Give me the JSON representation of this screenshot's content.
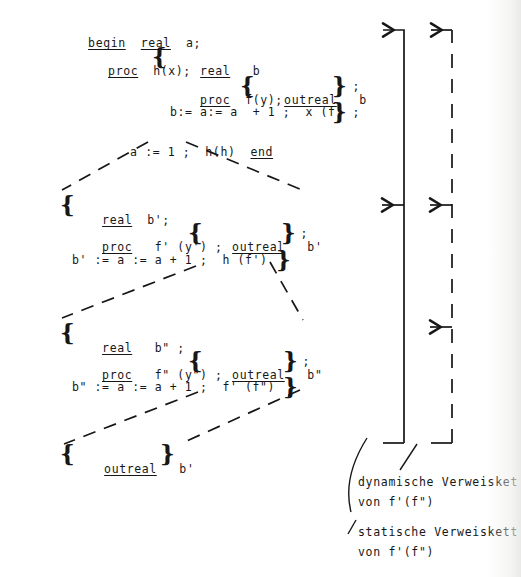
{
  "figure": {
    "kind": "program-block-structure-diagram",
    "background_color": "#ffffff",
    "ink_color": "#171717",
    "width": 521,
    "height": 577
  },
  "program": {
    "blocks": [
      {
        "name": "outer-block",
        "lines": [
          {
            "id": "l1",
            "segments": [
              {
                "text": "begin",
                "underline": true
              },
              {
                "text": "  ",
                "underline": false
              },
              {
                "text": "real",
                "underline": true
              },
              {
                "text": "  a;",
                "underline": false
              }
            ]
          },
          {
            "id": "l2",
            "segments": [
              {
                "text": "proc",
                "underline": true
              },
              {
                "text": "  h(x); ",
                "underline": false
              }
            ]
          },
          {
            "id": "l2b",
            "segments": [
              {
                "text": "real",
                "underline": true
              },
              {
                "text": "   b",
                "underline": false
              }
            ]
          },
          {
            "id": "l3",
            "segments": [
              {
                "text": "proc",
                "underline": true
              },
              {
                "text": "  f(y); ",
                "underline": false
              }
            ]
          },
          {
            "id": "l3b",
            "segments": [
              {
                "text": "outreal",
                "underline": true
              },
              {
                "text": "   b",
                "underline": false
              }
            ]
          },
          {
            "id": "l3c",
            "segments": [
              {
                "text": " ;",
                "underline": false
              }
            ]
          },
          {
            "id": "l4",
            "segments": [
              {
                "text": "b:= a:= a  + 1 ;  x (f)",
                "underline": false
              }
            ]
          },
          {
            "id": "l4b",
            "segments": [
              {
                "text": " ;",
                "underline": false
              }
            ]
          },
          {
            "id": "l5",
            "segments": [
              {
                "text": "a := 1 ;  h(h)  ",
                "underline": false
              },
              {
                "text": "end",
                "underline": true
              }
            ]
          }
        ]
      },
      {
        "name": "activation-record-1",
        "lines": [
          {
            "id": "m1",
            "segments": [
              {
                "text": "real",
                "underline": true
              },
              {
                "text": "  b';",
                "underline": false
              }
            ]
          },
          {
            "id": "m2",
            "segments": [
              {
                "text": "proc",
                "underline": true
              },
              {
                "text": "   f' (y') ; ",
                "underline": false
              }
            ]
          },
          {
            "id": "m2b",
            "segments": [
              {
                "text": "outreal",
                "underline": true
              },
              {
                "text": "   b'",
                "underline": false
              }
            ]
          },
          {
            "id": "m2c",
            "segments": [
              {
                "text": " ;",
                "underline": false
              }
            ]
          },
          {
            "id": "m3",
            "segments": [
              {
                "text": "b' := a := a + 1 ;  h (f')",
                "underline": false
              }
            ]
          }
        ]
      },
      {
        "name": "activation-record-2",
        "lines": [
          {
            "id": "n1",
            "segments": [
              {
                "text": "real",
                "underline": true
              },
              {
                "text": "   b\" ;",
                "underline": false
              }
            ]
          },
          {
            "id": "n2",
            "segments": [
              {
                "text": "proc",
                "underline": true
              },
              {
                "text": "   f\" (y\") ; ",
                "underline": false
              }
            ]
          },
          {
            "id": "n2b",
            "segments": [
              {
                "text": "outreal",
                "underline": true
              },
              {
                "text": "   b\"",
                "underline": false
              }
            ]
          },
          {
            "id": "n2c",
            "segments": [
              {
                "text": " ;",
                "underline": false
              }
            ]
          },
          {
            "id": "n3",
            "segments": [
              {
                "text": "b\" := a := a + 1 ;  f' (f\")",
                "underline": false
              }
            ]
          }
        ]
      },
      {
        "name": "activation-record-3",
        "lines": [
          {
            "id": "o1",
            "segments": [
              {
                "text": "outreal",
                "underline": true
              },
              {
                "text": "   b'",
                "underline": false
              }
            ]
          }
        ]
      }
    ]
  },
  "annotations": {
    "dynamic_chain": {
      "label_line1": "dynamische Verweisket",
      "label_line2": "von f'(f\")",
      "style": "solid"
    },
    "static_chain": {
      "label_line1": "statische Verweiskett",
      "label_line2": "von f'(f\")",
      "style": "dashed"
    }
  }
}
